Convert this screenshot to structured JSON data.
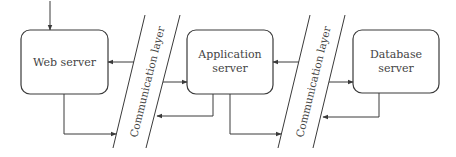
{
  "diagram": {
    "title": "",
    "nodes": [
      {
        "id": "web",
        "label_lines": [
          "Web server"
        ]
      },
      {
        "id": "app",
        "label_lines": [
          "Application",
          "server"
        ]
      },
      {
        "id": "db",
        "label_lines": [
          "Database",
          "server"
        ]
      }
    ],
    "layers": [
      {
        "id": "comm1",
        "label": "Communication layer"
      },
      {
        "id": "comm2",
        "label": "Communication layer"
      }
    ],
    "edges": [
      {
        "from": "external",
        "to": "web"
      },
      {
        "from": "web",
        "to": "comm1"
      },
      {
        "from": "comm1",
        "to": "web"
      },
      {
        "from": "comm1",
        "to": "app"
      },
      {
        "from": "app",
        "to": "comm1"
      },
      {
        "from": "app",
        "to": "comm2"
      },
      {
        "from": "comm2",
        "to": "app"
      },
      {
        "from": "comm2",
        "to": "db"
      },
      {
        "from": "db",
        "to": "comm2"
      }
    ],
    "colors": {
      "stroke": "#3a3a3a",
      "text": "#444444",
      "background": "#ffffff"
    }
  }
}
